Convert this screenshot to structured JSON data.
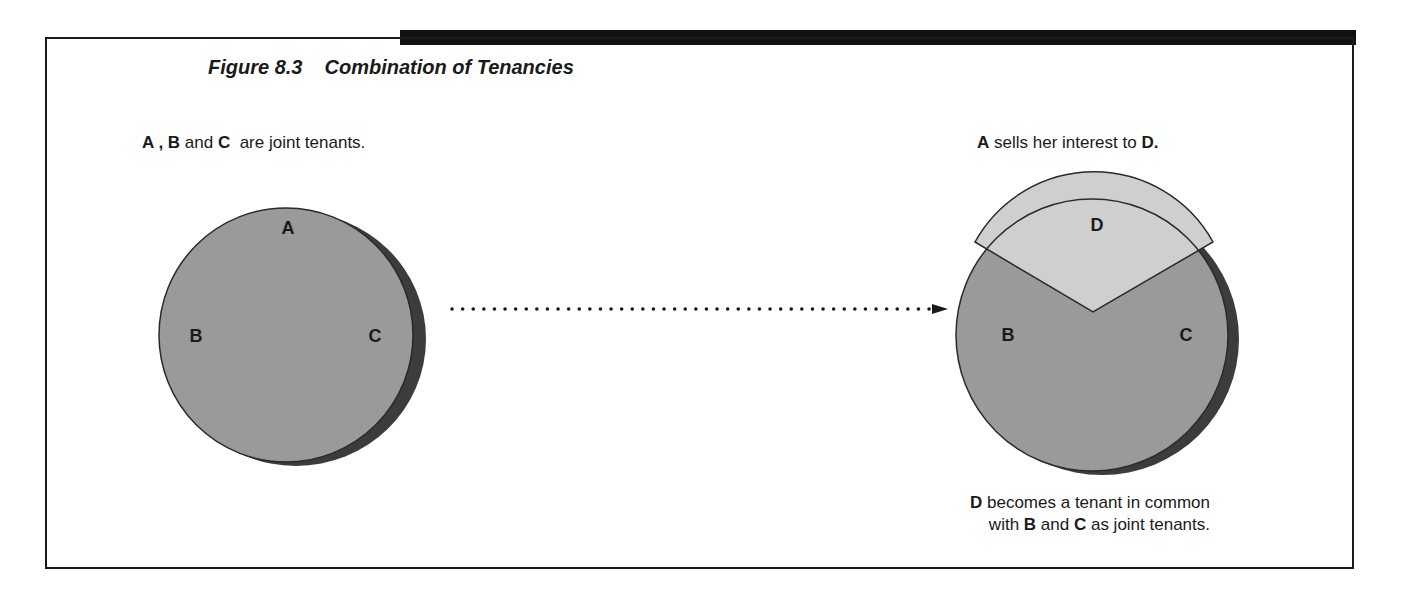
{
  "figure": {
    "number": "Figure 8.3",
    "title": "Combination of Tenancies"
  },
  "left_panel": {
    "caption": {
      "a": "A",
      "sep": " , ",
      "b": "B",
      "and": " and ",
      "c": "C",
      "rest": "  are joint tenants."
    },
    "labels": {
      "a": "A",
      "b": "B",
      "c": "C"
    }
  },
  "right_panel": {
    "caption": {
      "a": "A",
      "rest": " sells her interest to ",
      "d": "D."
    },
    "labels": {
      "d": "D",
      "b": "B",
      "c": "C"
    },
    "footer": {
      "d": "D",
      "line1_rest": " becomes a tenant in common",
      "with": "with ",
      "b": "B",
      "and": " and ",
      "c": "C",
      "line2_rest": " as joint tenants."
    }
  },
  "colors": {
    "circle_fill": "#9a9a9a",
    "wedge_fill": "#cfcfcf",
    "shadow": "#3c3c3c",
    "frame": "#1a1a1a"
  }
}
